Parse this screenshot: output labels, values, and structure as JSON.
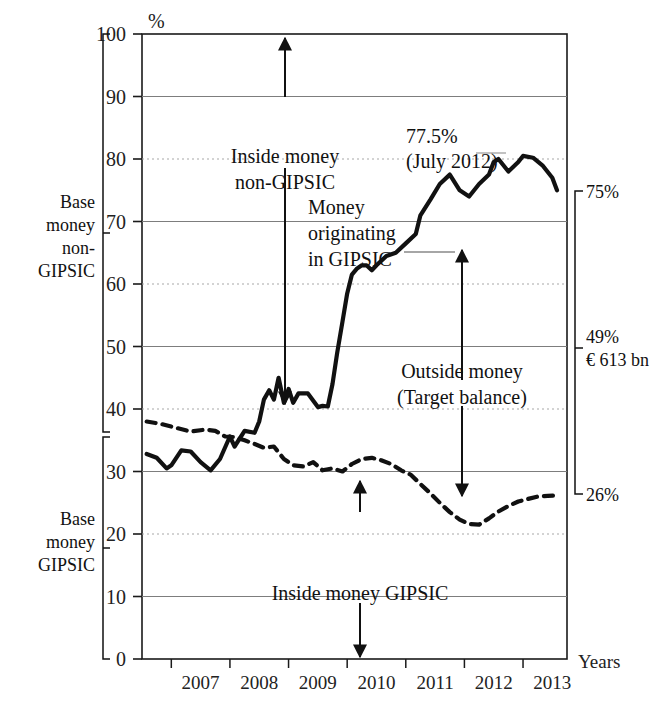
{
  "chart_data": {
    "type": "line",
    "title": "",
    "xlabel": "Years",
    "ylabel": "%",
    "ylim": [
      0,
      100
    ],
    "xlim": [
      2006.5,
      2013.75
    ],
    "grid": true,
    "legend": "none",
    "yticks": [
      0,
      10,
      20,
      30,
      40,
      50,
      60,
      70,
      80,
      90,
      100
    ],
    "ytick_labels": [
      "0",
      "10",
      "20",
      "30",
      "40",
      "50",
      "60",
      "70",
      "80",
      "90",
      "100"
    ],
    "xticks": [
      2007,
      2008,
      2009,
      2010,
      2011,
      2012,
      2013
    ],
    "xtick_labels": [
      "2007",
      "2008",
      "2009",
      "2010",
      "2011",
      "2012",
      "2013"
    ],
    "series": [
      {
        "name": "Money originating in GIPSIC",
        "style": "solid",
        "x": [
          2006.58,
          2006.75,
          2006.92,
          2007.0,
          2007.17,
          2007.33,
          2007.5,
          2007.67,
          2007.83,
          2008.0,
          2008.08,
          2008.25,
          2008.42,
          2008.5,
          2008.58,
          2008.67,
          2008.75,
          2008.83,
          2008.92,
          2009.0,
          2009.08,
          2009.17,
          2009.33,
          2009.5,
          2009.58,
          2009.67,
          2009.75,
          2009.83,
          2009.92,
          2010.0,
          2010.08,
          2010.17,
          2010.25,
          2010.33,
          2010.42,
          2010.5,
          2010.67,
          2010.83,
          2011.0,
          2011.17,
          2011.25,
          2011.42,
          2011.58,
          2011.75,
          2011.92,
          2012.08,
          2012.25,
          2012.42,
          2012.5,
          2012.58,
          2012.75,
          2012.92,
          2013.0,
          2013.17,
          2013.33,
          2013.5,
          2013.58
        ],
        "y": [
          32.8,
          32.2,
          30.5,
          31.0,
          33.4,
          33.2,
          31.5,
          30.2,
          32.0,
          35.6,
          34.0,
          36.5,
          36.2,
          38.0,
          41.5,
          43.0,
          41.5,
          45.0,
          41.0,
          43.2,
          41.0,
          42.5,
          42.5,
          40.3,
          40.5,
          40.4,
          44.0,
          49.0,
          54.0,
          58.5,
          61.5,
          62.5,
          63.0,
          63.0,
          62.2,
          63.0,
          64.5,
          65.0,
          66.5,
          68.0,
          71.0,
          73.5,
          76.0,
          77.5,
          75.0,
          74.0,
          76.0,
          77.5,
          79.5,
          80.0,
          78.0,
          79.5,
          80.5,
          80.2,
          79.0,
          77.0,
          75.0
        ]
      },
      {
        "name": "Base money GIPSIC (inside money GIPSIC)",
        "style": "dashed",
        "x": [
          2006.58,
          2006.83,
          2007.08,
          2007.33,
          2007.58,
          2007.75,
          2007.92,
          2008.08,
          2008.25,
          2008.42,
          2008.58,
          2008.75,
          2008.92,
          2009.08,
          2009.25,
          2009.42,
          2009.58,
          2009.75,
          2009.92,
          2010.08,
          2010.25,
          2010.42,
          2010.58,
          2010.75,
          2010.92,
          2011.08,
          2011.25,
          2011.42,
          2011.58,
          2011.75,
          2011.92,
          2012.08,
          2012.25,
          2012.42,
          2012.58,
          2012.75,
          2012.92,
          2013.08,
          2013.25,
          2013.42,
          2013.58
        ],
        "y": [
          38.0,
          37.6,
          37.0,
          36.4,
          36.7,
          36.5,
          35.6,
          35.5,
          35.0,
          34.4,
          33.8,
          34.0,
          32.0,
          31.0,
          30.8,
          31.5,
          30.2,
          30.5,
          30.0,
          31.2,
          32.0,
          32.2,
          31.8,
          31.2,
          30.2,
          29.5,
          28.0,
          26.5,
          25.0,
          23.5,
          22.3,
          21.6,
          21.5,
          22.5,
          23.6,
          24.5,
          25.2,
          25.6,
          26.0,
          26.1,
          26.2
        ]
      }
    ],
    "annotations": [
      {
        "name": "peak-label",
        "text_lines": [
          "77.5%",
          "(July 2012)"
        ],
        "x": 2011.55,
        "y": 83
      },
      {
        "name": "inside-money-non-gipsic",
        "text_lines": [
          "Inside money",
          "non-GIPSIC"
        ],
        "x": 2008.0,
        "y": 78
      },
      {
        "name": "money-originating-in-gipsic",
        "text_lines": [
          "Money",
          "originating",
          "in GIPSIC"
        ],
        "x": 2009.35,
        "y": 72
      },
      {
        "name": "outside-money",
        "text_lines": [
          "Outside money",
          "(Target balance)"
        ],
        "x": 2011.1,
        "y": 44
      },
      {
        "name": "inside-money-gipsic",
        "text_lines": [
          "Inside money GIPSIC"
        ],
        "x": 2010.2,
        "y": 12
      }
    ],
    "value_callouts": [
      {
        "name": "callout-75",
        "label": "75%",
        "y": 75
      },
      {
        "name": "callout-49",
        "label": "49%",
        "sublabel": "€ 613 bn",
        "y": 49
      },
      {
        "name": "callout-26",
        "label": "26%",
        "y": 26
      }
    ],
    "side_brackets": [
      {
        "name": "bracket-base-money-non-gipsic",
        "lines": [
          "Base",
          "money",
          "non-",
          "GIPSIC"
        ],
        "from": 39,
        "to": 100
      },
      {
        "name": "bracket-base-money-gipsic",
        "lines": [
          "Base",
          "money",
          "GIPSIC"
        ],
        "from": 0,
        "to": 39
      }
    ]
  },
  "axis": {
    "y_unit": "%",
    "x_title": "Years",
    "ytick_labels": [
      "100",
      "90",
      "80",
      "70",
      "60",
      "50",
      "40",
      "30",
      "20",
      "10",
      "0"
    ],
    "xtick_labels": [
      "2007",
      "2008",
      "2009",
      "2010",
      "2011",
      "2012",
      "2013"
    ]
  },
  "labels": {
    "peak_value": "77.5%",
    "peak_date": "(July 2012)",
    "inside_money_non_gipsic_l1": "Inside money",
    "inside_money_non_gipsic_l2": "non-GIPSIC",
    "money_orig_l1": "Money",
    "money_orig_l2": "originating",
    "money_orig_l3": "in GIPSIC",
    "outside_money_l1": "Outside money",
    "outside_money_l2": "(Target balance)",
    "inside_money_gipsic": "Inside money GIPSIC",
    "callout_75": "75%",
    "callout_49": "49%",
    "callout_49_sub": "€ 613 bn",
    "callout_26": "26%",
    "bracket_top_l1": "Base",
    "bracket_top_l2": "money",
    "bracket_top_l3": "non-",
    "bracket_top_l4": "GIPSIC",
    "bracket_bot_l1": "Base",
    "bracket_bot_l2": "money",
    "bracket_bot_l3": "GIPSIC"
  },
  "colors": {
    "ink": "#1a1a1a",
    "grid_solid": "#7d7d7d",
    "grid_dotted": "#a8a8a8",
    "background": "#ffffff"
  }
}
